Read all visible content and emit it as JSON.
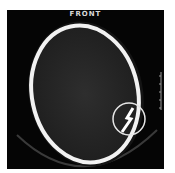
{
  "image": {
    "type": "axial CT scan of head",
    "orientation_label": "FRONT",
    "annotation": "circle highlighting skull fracture",
    "colors": {
      "background": "#050505",
      "bone": "#f2f2f2",
      "brain": "#2a2a2a",
      "annotation": "#e6e6e6",
      "page": "#ffffff"
    }
  }
}
